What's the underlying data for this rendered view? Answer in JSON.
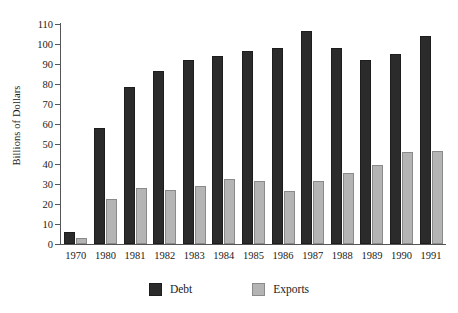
{
  "chart_data": {
    "type": "bar",
    "title": "",
    "subtitle": "",
    "xlabel": "",
    "ylabel": "Billions of Dollars",
    "ylim": [
      0,
      110
    ],
    "y_ticks": [
      0,
      10,
      20,
      30,
      40,
      50,
      60,
      70,
      80,
      90,
      100,
      110
    ],
    "grid": false,
    "legend_position": "bottom",
    "categories": [
      "1970",
      "1980",
      "1981",
      "1982",
      "1983",
      "1984",
      "1985",
      "1986",
      "1987",
      "1988",
      "1989",
      "1990",
      "1991"
    ],
    "series": [
      {
        "name": "Debt",
        "color": "#2b2b2b",
        "values": [
          6,
          58,
          78.5,
          86.5,
          92,
          94,
          96.5,
          98,
          106.5,
          98,
          92,
          95,
          104
        ]
      },
      {
        "name": "Exports",
        "color": "#b4b4b4",
        "values": [
          3,
          22.5,
          28,
          27,
          29,
          32.5,
          31.5,
          26.5,
          31.5,
          35.5,
          39.5,
          46,
          46.5
        ]
      }
    ]
  }
}
